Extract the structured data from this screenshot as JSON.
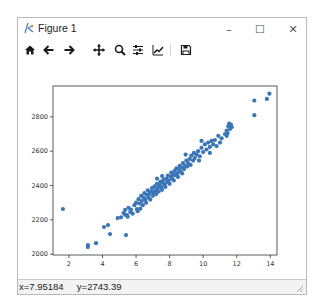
{
  "window": {
    "title": "Figure 1",
    "controls": {
      "minimize": "–",
      "maximize": "☐",
      "close": "✕"
    }
  },
  "toolbar": {
    "buttons": [
      {
        "name": "home",
        "icon": "home-icon"
      },
      {
        "name": "back",
        "icon": "arrow-left-icon"
      },
      {
        "name": "forward",
        "icon": "arrow-right-icon"
      },
      {
        "name": "pan",
        "icon": "move-icon"
      },
      {
        "name": "zoom",
        "icon": "magnifier-icon"
      },
      {
        "name": "configure-subplots",
        "icon": "sliders-icon"
      },
      {
        "name": "edit-axis",
        "icon": "line-chart-icon"
      },
      {
        "name": "save",
        "icon": "floppy-disk-icon"
      }
    ]
  },
  "statusbar": {
    "coords": "x=7.95184     y=2743.39"
  },
  "colors": {
    "marker": "#3a75b8",
    "axes": "#333333"
  },
  "chart_data": {
    "type": "scatter",
    "title": "",
    "xlabel": "",
    "ylabel": "",
    "xlim": [
      1.05,
      14.4
    ],
    "ylim": [
      1995,
      2980
    ],
    "xticks": [
      2,
      4,
      6,
      8,
      10,
      12,
      14
    ],
    "yticks": [
      2000,
      2200,
      2400,
      2600,
      2800
    ],
    "grid": false,
    "legend": null,
    "points": [
      [
        1.64,
        2263
      ],
      [
        3.13,
        2041
      ],
      [
        3.13,
        2053
      ],
      [
        3.61,
        2064
      ],
      [
        4.09,
        2158
      ],
      [
        4.33,
        2169
      ],
      [
        4.45,
        2117
      ],
      [
        5.4,
        2111
      ],
      [
        5.1,
        2215
      ],
      [
        5.25,
        2240
      ],
      [
        5.35,
        2258
      ],
      [
        5.45,
        2228
      ],
      [
        5.55,
        2270
      ],
      [
        5.65,
        2245
      ],
      [
        5.8,
        2236
      ],
      [
        5.9,
        2285
      ],
      [
        5.35,
        2230
      ],
      [
        5.5,
        2218
      ],
      [
        6.0,
        2300
      ],
      [
        6.05,
        2262
      ],
      [
        6.15,
        2320
      ],
      [
        6.2,
        2295
      ],
      [
        6.3,
        2340
      ],
      [
        6.35,
        2310
      ],
      [
        6.4,
        2285
      ],
      [
        6.45,
        2330
      ],
      [
        6.5,
        2355
      ],
      [
        6.55,
        2318
      ],
      [
        6.6,
        2300
      ],
      [
        6.65,
        2345
      ],
      [
        6.7,
        2372
      ],
      [
        6.75,
        2330
      ],
      [
        6.8,
        2352
      ],
      [
        6.85,
        2318
      ],
      [
        6.9,
        2365
      ],
      [
        6.95,
        2385
      ],
      [
        7.0,
        2340
      ],
      [
        7.05,
        2360
      ],
      [
        7.1,
        2395
      ],
      [
        7.15,
        2372
      ],
      [
        7.2,
        2350
      ],
      [
        7.25,
        2410
      ],
      [
        7.3,
        2385
      ],
      [
        7.35,
        2365
      ],
      [
        7.4,
        2402
      ],
      [
        7.45,
        2422
      ],
      [
        7.5,
        2390
      ],
      [
        7.55,
        2375
      ],
      [
        7.6,
        2415
      ],
      [
        7.65,
        2435
      ],
      [
        7.7,
        2405
      ],
      [
        7.75,
        2392
      ],
      [
        7.8,
        2440
      ],
      [
        7.85,
        2420
      ],
      [
        7.9,
        2458
      ],
      [
        7.95,
        2430
      ],
      [
        8.0,
        2410
      ],
      [
        8.05,
        2452
      ],
      [
        8.1,
        2475
      ],
      [
        8.15,
        2440
      ],
      [
        8.2,
        2462
      ],
      [
        8.25,
        2430
      ],
      [
        8.3,
        2485
      ],
      [
        8.35,
        2460
      ],
      [
        8.4,
        2500
      ],
      [
        8.45,
        2472
      ],
      [
        8.5,
        2450
      ],
      [
        8.55,
        2495
      ],
      [
        8.6,
        2515
      ],
      [
        8.65,
        2480
      ],
      [
        8.7,
        2505
      ],
      [
        8.75,
        2470
      ],
      [
        8.8,
        2530
      ],
      [
        8.85,
        2495
      ],
      [
        8.9,
        2515
      ],
      [
        9.0,
        2545
      ],
      [
        9.05,
        2510
      ],
      [
        9.1,
        2530
      ],
      [
        9.2,
        2555
      ],
      [
        9.25,
        2520
      ],
      [
        9.3,
        2575
      ],
      [
        9.4,
        2545
      ],
      [
        9.45,
        2590
      ],
      [
        9.5,
        2560
      ],
      [
        9.6,
        2580
      ],
      [
        9.7,
        2600
      ],
      [
        9.8,
        2570
      ],
      [
        9.9,
        2620
      ],
      [
        10.0,
        2595
      ],
      [
        10.1,
        2640
      ],
      [
        10.2,
        2610
      ],
      [
        10.3,
        2650
      ],
      [
        10.4,
        2625
      ],
      [
        10.5,
        2660
      ],
      [
        10.6,
        2640
      ],
      [
        10.7,
        2665
      ],
      [
        10.8,
        2630
      ],
      [
        10.9,
        2690
      ],
      [
        11.0,
        2650
      ],
      [
        11.1,
        2675
      ],
      [
        11.3,
        2700
      ],
      [
        11.4,
        2720
      ],
      [
        11.5,
        2745
      ],
      [
        11.55,
        2760
      ],
      [
        11.6,
        2730
      ],
      [
        11.45,
        2705
      ],
      [
        11.65,
        2755
      ],
      [
        11.7,
        2740
      ],
      [
        11.4,
        2690
      ],
      [
        13.05,
        2810
      ],
      [
        13.05,
        2895
      ],
      [
        13.8,
        2905
      ],
      [
        13.95,
        2935
      ],
      [
        6.25,
        2265
      ],
      [
        5.7,
        2260
      ],
      [
        4.9,
        2210
      ],
      [
        6.1,
        2250
      ],
      [
        7.55,
        2455
      ],
      [
        8.95,
        2580
      ],
      [
        9.75,
        2545
      ],
      [
        10.4,
        2590
      ],
      [
        9.9,
        2660
      ],
      [
        7.25,
        2440
      ]
    ]
  }
}
